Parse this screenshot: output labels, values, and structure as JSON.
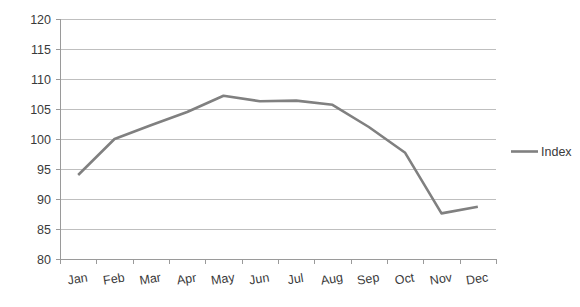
{
  "chart_data": {
    "type": "line",
    "title": "",
    "xlabel": "",
    "ylabel": "",
    "categories": [
      "Jan",
      "Feb",
      "Mar",
      "Apr",
      "May",
      "Jun",
      "Jul",
      "Aug",
      "Sep",
      "Oct",
      "Nov",
      "Dec"
    ],
    "series": [
      {
        "name": "Index",
        "color": "#808080",
        "values": [
          94.0,
          100.0,
          102.3,
          104.5,
          107.2,
          106.3,
          106.4,
          105.7,
          102.0,
          97.7,
          87.6,
          88.7
        ]
      }
    ],
    "ylim": [
      80,
      120
    ],
    "yticks": [
      80,
      85,
      90,
      95,
      100,
      105,
      110,
      115,
      120
    ],
    "ytick_labels": [
      "80",
      "85",
      "90",
      "95",
      "100",
      "105",
      "110",
      "115",
      "120"
    ],
    "grid": "horizontal",
    "legend_position": "right",
    "legend_entries": [
      "Index"
    ]
  },
  "colors": {
    "series": "#808080",
    "gridline": "#bfbfbf",
    "axis": "#9a9a9a",
    "text": "#3a3a3a",
    "background": "#ffffff"
  },
  "legend": {
    "index_label": "Index"
  }
}
